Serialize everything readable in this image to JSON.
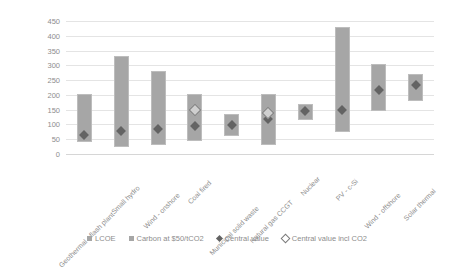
{
  "chart_data": {
    "type": "bar",
    "title": "",
    "subtitle": "",
    "xlabel": "",
    "ylabel": "",
    "ylim": [
      0,
      450
    ],
    "ytick_step": 50,
    "yticks": [
      0,
      50,
      100,
      150,
      200,
      250,
      300,
      350,
      400,
      450
    ],
    "grid": true,
    "orientation": "vertical",
    "bar_style": "floating-range",
    "legend_position": "bottom",
    "categories": [
      "Geothermal - flash plant",
      "Small hydro",
      "Wind - onshore",
      "Coal fired",
      "Municipal solid waste",
      "Natural gas CCGT",
      "Nuclear",
      "PV - c-Si",
      "Wind - offshore",
      "Solar thermal"
    ],
    "legend": [
      {
        "label": "LCOE",
        "marker": "square",
        "color": "#a6a6a6"
      },
      {
        "label": "Carbon at $50/tCO2",
        "marker": "square",
        "color": "#a6a6a6"
      },
      {
        "label": "Central value",
        "marker": "diamond-filled",
        "color": "#636363"
      },
      {
        "label": "Central value incl CO2",
        "marker": "diamond-hollow",
        "color": "#7a7a7a"
      }
    ],
    "series": [
      {
        "name": "LCOE",
        "type": "range-bar",
        "low": [
          40,
          25,
          30,
          45,
          60,
          30,
          115,
          75,
          145,
          180
        ],
        "high": [
          203,
          333,
          282,
          203,
          135,
          203,
          170,
          430,
          305,
          270
        ]
      },
      {
        "name": "Central value",
        "type": "diamond-filled",
        "values": [
          65,
          78,
          84,
          95,
          97,
          118,
          145,
          150,
          215,
          235
        ]
      },
      {
        "name": "Central value incl CO2",
        "type": "diamond-hollow",
        "values": [
          null,
          null,
          null,
          150,
          null,
          140,
          null,
          null,
          null,
          null
        ]
      }
    ]
  },
  "colors": {
    "bar": "#a6a6a6",
    "bar_border": "#bdbdbd",
    "marker_filled": "#636363",
    "marker_hollow_border": "#7a7a7a",
    "grid": "#e4e4e4",
    "text": "#8d8d8d",
    "background": "#ffffff"
  }
}
